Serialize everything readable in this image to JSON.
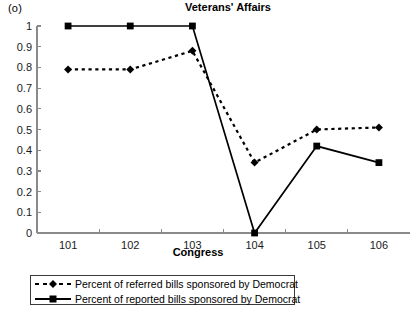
{
  "panel": {
    "label": "(o)"
  },
  "chart_data": {
    "type": "line",
    "title": "Veterans' Affairs",
    "xlabel": "Congress",
    "ylabel": "",
    "categories": [
      "101",
      "102",
      "103",
      "104",
      "105",
      "106"
    ],
    "ylim": [
      0,
      1
    ],
    "ytick_labels": [
      "0",
      "0.1",
      "0.2",
      "0.3",
      "0.4",
      "0.5",
      "0.6",
      "0.7",
      "0.8",
      "0.9",
      "1"
    ],
    "ytick_values": [
      0,
      0.1,
      0.2,
      0.3,
      0.4,
      0.5,
      0.6,
      0.7,
      0.8,
      0.9,
      1
    ],
    "grid": false,
    "legend_position": "below-plot",
    "series": [
      {
        "name": "Percent of referred bills sponsored by Democrat",
        "marker": "diamond",
        "line_style": "dashed",
        "color": "#000000",
        "values": [
          0.79,
          0.79,
          0.88,
          0.34,
          0.5,
          0.51
        ]
      },
      {
        "name": "Percent of reported bills sponsored by Democrat",
        "marker": "square",
        "line_style": "solid",
        "color": "#000000",
        "values": [
          1.0,
          1.0,
          1.0,
          0.0,
          0.42,
          0.34
        ]
      }
    ]
  }
}
